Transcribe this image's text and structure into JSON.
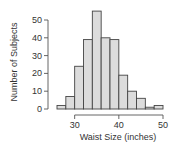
{
  "chart_data": {
    "type": "bar",
    "subtype": "histogram",
    "title": "",
    "xlabel": "Waist Size (inches)",
    "ylabel": "Number of Subjects",
    "bin_edges": [
      26,
      28,
      30,
      32,
      34,
      36,
      38,
      40,
      42,
      44,
      46,
      48,
      50
    ],
    "categories": [
      "26-28",
      "28-30",
      "30-32",
      "32-34",
      "34-36",
      "36-38",
      "38-40",
      "40-42",
      "42-44",
      "44-46",
      "46-48",
      "48-50"
    ],
    "values": [
      2,
      7,
      24,
      39,
      55,
      40,
      39,
      19,
      10,
      6,
      1,
      2
    ],
    "xlim": [
      26,
      50
    ],
    "ylim": [
      0,
      55
    ],
    "x_ticks": [
      30,
      40,
      50
    ],
    "y_ticks": [
      0,
      10,
      20,
      30,
      40,
      50
    ],
    "grid": false,
    "legend": null,
    "colors": {
      "bar_fill": "#dcdcdc",
      "bar_edge": "#444444",
      "axis": "#555555",
      "text": "#333333"
    }
  },
  "labels": {
    "xlabel": "Waist Size (inches)",
    "ylabel": "Number of Subjects",
    "y_ticks": [
      "0",
      "10",
      "20",
      "30",
      "40",
      "50"
    ],
    "x_ticks": [
      "30",
      "40",
      "50"
    ]
  }
}
